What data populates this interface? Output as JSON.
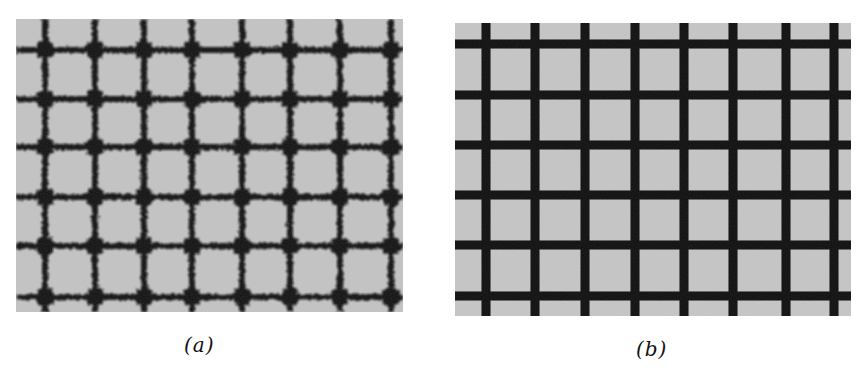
{
  "figure": {
    "panels": [
      {
        "id": "a",
        "caption": "(a)",
        "description": "Blurry, speckled dark grid lines on light gray background with dark blobs at intersections",
        "background_color": "#c4c4c4",
        "line_color": "#111111",
        "vertical_lines_x": [
          29,
          79,
          128,
          176,
          226,
          274,
          324,
          375
        ],
        "horizontal_lines_y": [
          31,
          80,
          128,
          178,
          227,
          278
        ],
        "line_width": 6,
        "node_size": 16
      },
      {
        "id": "b",
        "caption": "(b)",
        "description": "Sharp, solid dark grid lines on light gray background",
        "background_color": "#c6c6c6",
        "line_color": "#0c0c0c",
        "vertical_lines_x": [
          31,
          80,
          130,
          180,
          229,
          278,
          331,
          379
        ],
        "horizontal_lines_y": [
          21,
          72,
          122,
          172,
          222,
          273
        ],
        "line_width": 9
      }
    ]
  }
}
